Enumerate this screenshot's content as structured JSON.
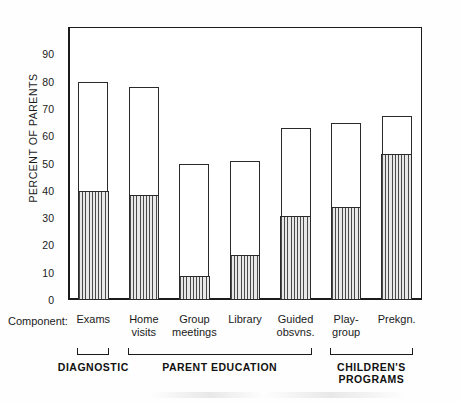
{
  "figure": {
    "component_row_label": "Component:",
    "y_axis_title": "PERCENT OF PARENTS"
  },
  "chart_data": {
    "type": "bar",
    "title": "",
    "subtitle": "",
    "xlabel": "Component:",
    "ylabel": "PERCENT OF PARENTS",
    "ylim": [
      0,
      100
    ],
    "yticks": [
      0,
      10,
      20,
      30,
      40,
      50,
      60,
      70,
      80,
      90
    ],
    "ytick_labels": [
      "0",
      "10",
      "20",
      "30",
      "40",
      "50",
      "60",
      "70",
      "80",
      "90"
    ],
    "grid": false,
    "legend": false,
    "stacked": true,
    "categories": [
      "Exams",
      "Home visits",
      "Group meetings",
      "Library",
      "Guided obsvns.",
      "Play-group",
      "Prekgn."
    ],
    "category_lines": [
      [
        "Exams"
      ],
      [
        "Home",
        "visits"
      ],
      [
        "Group",
        "meetings"
      ],
      [
        "Library"
      ],
      [
        "Guided",
        "obsvns."
      ],
      [
        "Play-",
        "group"
      ],
      [
        "Prekgn."
      ]
    ],
    "series": [
      {
        "name": "hatched-lower-segment",
        "values": [
          40,
          38.5,
          9,
          16.5,
          31,
          34,
          53.5
        ]
      },
      {
        "name": "open-upper-segment",
        "values": [
          40,
          39.5,
          41,
          34.5,
          32,
          31,
          14
        ]
      }
    ],
    "totals": [
      80,
      78,
      50,
      51,
      63,
      65,
      67.5
    ],
    "groups": [
      {
        "label": "DIAGNOSTIC",
        "label_lines": [
          "DIAGNOSTIC"
        ],
        "members": [
          "Exams"
        ]
      },
      {
        "label": "PARENT EDUCATION",
        "label_lines": [
          "PARENT EDUCATION"
        ],
        "members": [
          "Home visits",
          "Group meetings",
          "Library",
          "Guided obsvns."
        ]
      },
      {
        "label": "CHILDREN'S PROGRAMS",
        "label_lines": [
          "CHILDREN'S",
          "PROGRAMS"
        ],
        "members": [
          "Play-group",
          "Prekgn."
        ]
      }
    ],
    "colors": {
      "axis": "#1b1b1b",
      "bar_outline": "#2a2a2a",
      "bar_open": "#ffffff",
      "bar_hatch": "#4a4a4a",
      "background": "#fefefe"
    }
  }
}
